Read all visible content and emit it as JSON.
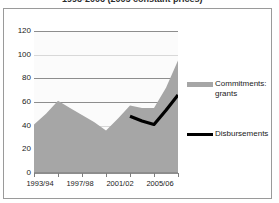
{
  "figure": {
    "title_cropped": "1993-2006 (2005 constant prices)",
    "unit_label": "USD Million"
  },
  "legend": {
    "position": "right",
    "entries": [
      {
        "label": "Commitments: grants",
        "color": "#a6a6a6",
        "marker": "area-swatch"
      },
      {
        "label": "Disbursements",
        "color": "#000000",
        "marker": "line-swatch"
      }
    ]
  },
  "axes": {
    "y_ticks": [
      "120",
      "100",
      "80",
      "60",
      "40",
      "20",
      "0"
    ],
    "x_ticks": [
      "1993/94",
      "1997/98",
      "2001/02",
      "2005/06"
    ]
  },
  "chart_data": {
    "type": "area",
    "title": "1993-2006 (2005 constant prices)",
    "subtitle": "",
    "xlabel": "",
    "ylabel": "USD Million",
    "ylim": [
      0,
      120
    ],
    "y_ticks": [
      0,
      20,
      40,
      60,
      80,
      100,
      120
    ],
    "grid": "horizontal",
    "legend_position": "right",
    "categories": [
      "1993/94",
      "1994/95",
      "1995/96",
      "1996/97",
      "1997/98",
      "1998/99",
      "1999/00",
      "2000/01",
      "2001/02",
      "2002/03",
      "2003/04",
      "2004/05",
      "2005/06"
    ],
    "x_tick_labels_shown": [
      "1993/94",
      "1997/98",
      "2001/02",
      "2005/06"
    ],
    "series": [
      {
        "name": "Commitments: grants",
        "type": "area",
        "color": "#a6a6a6",
        "values": [
          41,
          50,
          61,
          55,
          49,
          43,
          36,
          46,
          57,
          55,
          55,
          72,
          95
        ]
      },
      {
        "name": "Disbursements",
        "type": "line",
        "color": "#000000",
        "values": [
          null,
          null,
          null,
          null,
          null,
          null,
          null,
          null,
          48,
          44,
          41,
          53,
          66
        ]
      }
    ]
  }
}
